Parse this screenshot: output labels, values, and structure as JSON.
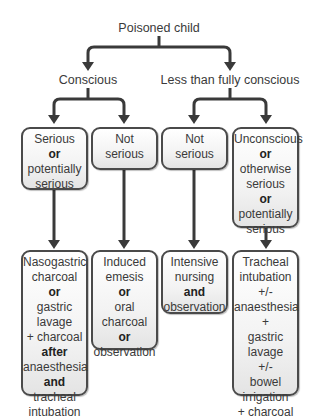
{
  "title": "Poisoned child",
  "level1": [
    {
      "label": "Conscious"
    },
    {
      "label": "Less than fully conscious"
    }
  ],
  "assessment_boxes": [
    {
      "lines": [
        {
          "t": "Serious",
          "b": false
        },
        {
          "t": "or",
          "b": true
        },
        {
          "t": "potentially",
          "b": false
        },
        {
          "t": "serious",
          "b": false
        }
      ]
    },
    {
      "lines": [
        {
          "t": "Not",
          "b": false
        },
        {
          "t": "serious",
          "b": false
        }
      ]
    },
    {
      "lines": [
        {
          "t": "Not",
          "b": false
        },
        {
          "t": "serious",
          "b": false
        }
      ]
    },
    {
      "lines": [
        {
          "t": "Unconscious",
          "b": false
        },
        {
          "t": "or",
          "b": true
        },
        {
          "t": "otherwise",
          "b": false
        },
        {
          "t": "serious",
          "b": false
        },
        {
          "t": "or",
          "b": true
        },
        {
          "t": "potentially",
          "b": false
        },
        {
          "t": "serious",
          "b": false
        }
      ]
    }
  ],
  "treatment_boxes": [
    {
      "lines": [
        {
          "t": "Nasogastric",
          "b": false
        },
        {
          "t": "charcoal",
          "b": false
        },
        {
          "t": "or",
          "b": true
        },
        {
          "t": "gastric",
          "b": false
        },
        {
          "t": "lavage",
          "b": false
        },
        {
          "t": "+ charcoal",
          "b": false
        },
        {
          "t": "after",
          "b": true
        },
        {
          "t": "anaesthesia",
          "b": false
        },
        {
          "t": "and",
          "b": true
        },
        {
          "t": "tracheal",
          "b": false
        },
        {
          "t": "intubation",
          "b": false
        }
      ]
    },
    {
      "lines": [
        {
          "t": "Induced",
          "b": false
        },
        {
          "t": "emesis",
          "b": false
        },
        {
          "t": "or",
          "b": true
        },
        {
          "t": "oral",
          "b": false
        },
        {
          "t": "charcoal",
          "b": false
        },
        {
          "t": "or",
          "b": true
        },
        {
          "t": "observation",
          "b": false
        }
      ]
    },
    {
      "lines": [
        {
          "t": "Intensive",
          "b": false
        },
        {
          "t": "nursing",
          "b": false
        },
        {
          "t": "and",
          "b": true
        },
        {
          "t": "observation",
          "b": false
        }
      ]
    },
    {
      "lines": [
        {
          "t": "Tracheal",
          "b": false
        },
        {
          "t": "intubation",
          "b": false
        },
        {
          "t": "+/-",
          "b": false
        },
        {
          "t": "anaesthesia",
          "b": false
        },
        {
          "t": "+",
          "b": false
        },
        {
          "t": "gastric",
          "b": false
        },
        {
          "t": "lavage",
          "b": false
        },
        {
          "t": "+/-",
          "b": false
        },
        {
          "t": "bowel",
          "b": false
        },
        {
          "t": "irrigation",
          "b": false
        },
        {
          "t": "+ charcoal",
          "b": false
        }
      ]
    }
  ],
  "colors": {
    "line": "#3a3a3a",
    "box_border": "#4a4a4a",
    "box_fill_top": "#ffffff",
    "box_fill_bottom": "#e4e4e4"
  }
}
